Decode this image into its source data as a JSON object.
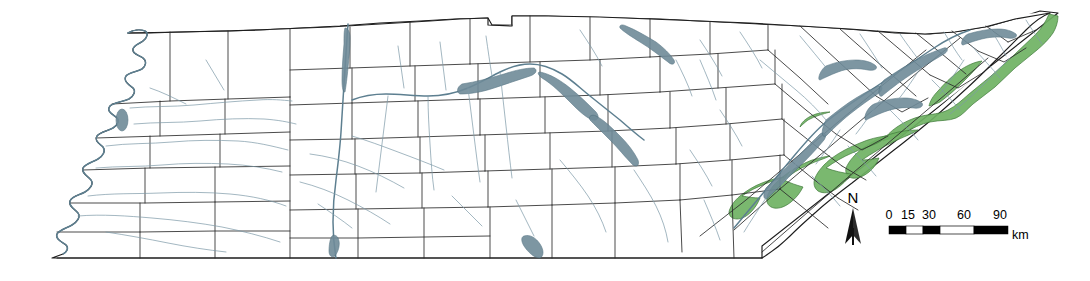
{
  "figure": {
    "kind": "reference-map",
    "background_color": "#ffffff"
  },
  "map": {
    "state_outline_color": "#1d1d1d",
    "county_line_color": "#2b2b2b",
    "river_color": "#7d9aa8",
    "reservoir_color": "#6f8b99",
    "land_fill": "#ffffff",
    "highlight_fill": "#6fb263",
    "highlight_stroke": "#3f7a3a"
  },
  "north_arrow": {
    "label": "N",
    "icon": "north-arrow-icon"
  },
  "scale_bar": {
    "ticks": [
      "0",
      "15",
      "30",
      "60",
      "90"
    ],
    "unit": "km",
    "segments": [
      "dark",
      "light",
      "dark",
      "light",
      "dark"
    ]
  }
}
